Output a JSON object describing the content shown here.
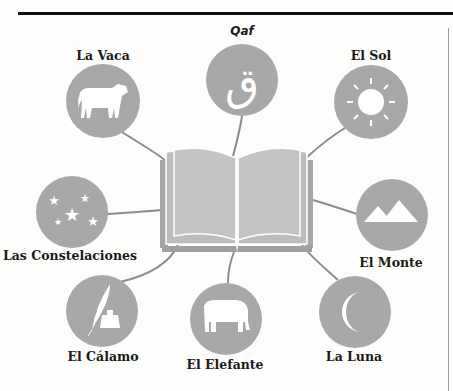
{
  "colors": {
    "circle_fill": "#a8a8a8",
    "connector": "#8c8c8c",
    "icon": "#ffffff",
    "book_page": "#c2c2c2",
    "book_edge": "#9e9e9e",
    "rule": "#111111"
  },
  "center": {
    "name": "book",
    "icon": "open-book-icon"
  },
  "nodes": [
    {
      "id": "qaf",
      "label": "Qaf",
      "icon": "arabic-letter-qaf-icon",
      "glyph": "ق",
      "italic": true
    },
    {
      "id": "vaca",
      "label": "La Vaca",
      "icon": "cow-icon"
    },
    {
      "id": "sol",
      "label": "El Sol",
      "icon": "sun-icon"
    },
    {
      "id": "constelaciones",
      "label": "Las Constelaciones",
      "icon": "stars-icon"
    },
    {
      "id": "monte",
      "label": "El Monte",
      "icon": "mountains-icon"
    },
    {
      "id": "calamo",
      "label": "El Cálamo",
      "icon": "quill-and-inkwell-icon"
    },
    {
      "id": "elefante",
      "label": "El Elefante",
      "icon": "elephant-icon"
    },
    {
      "id": "luna",
      "label": "La Luna",
      "icon": "crescent-moon-icon"
    }
  ]
}
